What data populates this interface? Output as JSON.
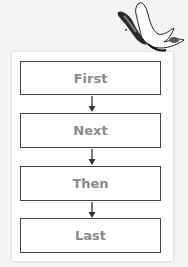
{
  "diagram": {
    "type": "flowchart",
    "direction": "top-to-bottom",
    "steps": [
      {
        "label": "First"
      },
      {
        "label": "Next"
      },
      {
        "label": "Then"
      },
      {
        "label": "Last"
      }
    ],
    "connectors": [
      "down-arrow",
      "down-arrow",
      "down-arrow"
    ],
    "decoration": "butterfly-icon",
    "colors": {
      "text": "#8a8a8a",
      "border": "#444444",
      "background": "#f4f4f4",
      "card": "#ffffff"
    }
  }
}
